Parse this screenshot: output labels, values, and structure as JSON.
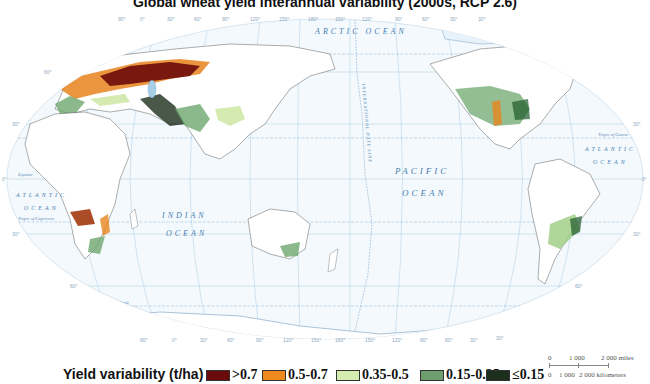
{
  "title": "Global wheat yield interannual variability (2000s, RCP 2.6)",
  "map": {
    "projection": "world map, Pacific-centered, elliptical",
    "oceans": {
      "arctic": "ARCTIC OCEAN",
      "pacific_1": "PACIFIC",
      "pacific_2": "OCEAN",
      "atlantic_w_1": "ATLANTIC",
      "atlantic_w_2": "OCEAN",
      "atlantic_e_1": "ATLANTIC",
      "atlantic_e_2": "OCEAN",
      "indian_1": "INDIAN",
      "indian_2": "OCEAN"
    },
    "lines": {
      "arctic_circle": "Arctic Circle",
      "tropic_cancer": "Tropic of Cancer",
      "equator": "Equator",
      "tropic_capricorn": "Tropic of Capricorn",
      "antarctic_circle": "Antarctic Circle",
      "date_line": "INTERNATIONAL DATE LINE"
    },
    "longitude_labels": [
      "90°",
      "0°",
      "30°",
      "60°",
      "90°",
      "120°",
      "150°",
      "180°",
      "150°",
      "120°",
      "90°",
      "60°",
      "30°",
      "30°"
    ],
    "latitude_labels": [
      "60°",
      "30°",
      "0°",
      "30°",
      "60°"
    ],
    "data_colors": {
      "very_high": "#6b0a0a",
      "high": "#e8841c",
      "medium": "#cfe8a8",
      "low": "#6fa86f",
      "very_low": "#1a3a1a"
    }
  },
  "legend": {
    "title": "Yield variability (t/ha)",
    "items": [
      {
        "label": ">0.7",
        "color": "#6b0a0a"
      },
      {
        "label": "0.5-0.7",
        "color": "#ef8a1f"
      },
      {
        "label": "0.35-0.5",
        "color": "#d4ecb0"
      },
      {
        "label": "0.15-0.35",
        "color": "#6e9e6e"
      },
      {
        "label": "≤0.15",
        "color": "#1c2e1c"
      }
    ]
  },
  "scale": {
    "miles_ticks": [
      "0",
      "1 000",
      "2 000 miles"
    ],
    "km_ticks": [
      "0",
      "1 000",
      "2 000 kilometers"
    ]
  }
}
